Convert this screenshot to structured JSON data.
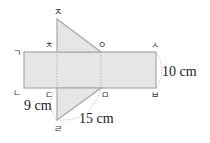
{
  "diagram": {
    "type": "net-of-triangular-prism",
    "colors": {
      "fill": "#e6e6e6",
      "stroke": "#a8a8a8",
      "fold_line": "#b5b5b5",
      "dim_arc": "#b0b0b0"
    },
    "vertices": {
      "g": "ㄱ",
      "n": "ㄴ",
      "d": "ㄷ",
      "r": "ㄹ",
      "m": "ㅁ",
      "b": "ㅂ",
      "s": "ㅅ",
      "o": "ㅇ",
      "j": "ㅈ",
      "ch": "ㅊ"
    },
    "dimensions": {
      "right_side": "10 cm",
      "left_leg": "9 cm",
      "hypotenuse": "15 cm"
    }
  }
}
